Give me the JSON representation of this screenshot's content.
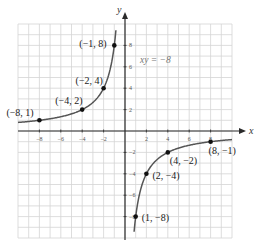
{
  "chart_data": {
    "type": "line",
    "title": "",
    "equation_label": "xy = −8",
    "xlabel": "x",
    "ylabel": "y",
    "xlim": [
      -10,
      10
    ],
    "ylim": [
      -10,
      10
    ],
    "grid": true,
    "x_ticks": [
      -8,
      -6,
      -4,
      -2,
      2,
      4,
      6,
      8
    ],
    "y_ticks": [
      -8,
      -6,
      -4,
      -2,
      2,
      4,
      6,
      8
    ],
    "x_tick_labels": [
      "−8",
      "−6",
      "−4",
      "−2",
      "2",
      "4",
      "6",
      "8"
    ],
    "y_tick_labels": [
      "−8",
      "−6",
      "−4",
      "−2",
      "2",
      "4",
      "6",
      "8"
    ],
    "series": [
      {
        "name": "xy = -8 (branch x<0)",
        "function": "y = -8/x",
        "points": [
          [
            -8,
            1
          ],
          [
            -4,
            2
          ],
          [
            -2,
            4
          ],
          [
            -1,
            8
          ]
        ],
        "labels": [
          "(−8, 1)",
          "(−4, 2)",
          "(−2, 4)",
          "(−1, 8)"
        ]
      },
      {
        "name": "xy = -8 (branch x>0)",
        "function": "y = -8/x",
        "points": [
          [
            1,
            -8
          ],
          [
            2,
            -4
          ],
          [
            4,
            -2
          ],
          [
            8,
            -1
          ]
        ],
        "labels": [
          "(1, −8)",
          "(2, −4)",
          "(4, −2)",
          "(8, −1)"
        ]
      }
    ]
  }
}
